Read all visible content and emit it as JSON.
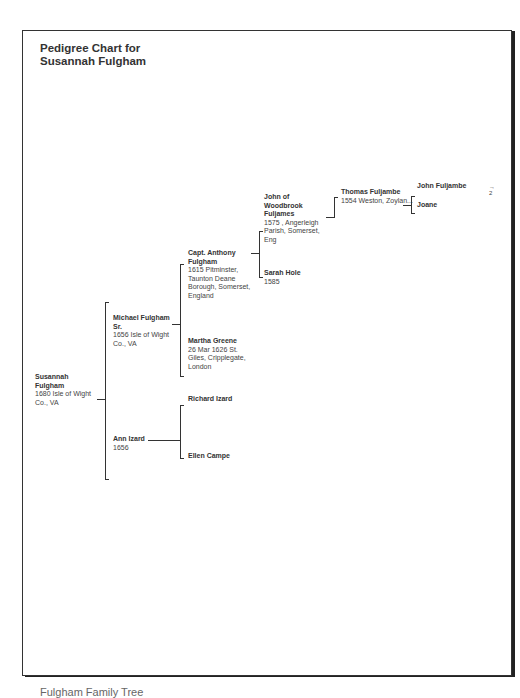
{
  "title_line1": "Pedigree Chart for",
  "title_line2": "Susannah Fulgham",
  "people": {
    "p1": {
      "name": "Susannah Fulgham",
      "name1": "Susannah",
      "name2": "Fulgham",
      "d1": "1680 Isle of Wight",
      "d2": "Co., VA"
    },
    "p2": {
      "name1": "Michael Fulgham",
      "name2": "Sr.",
      "d1": "1656 Isle of Wight",
      "d2": "Co., VA"
    },
    "p3": {
      "name1": "Ann Izard",
      "d1": "1656"
    },
    "p4": {
      "name1": "Capt. Anthony",
      "name2": "Fulgham",
      "d1": "1615 Pitminster,",
      "d2": "Taunton Deane",
      "d3": "Borough, Somerset,",
      "d4": "England"
    },
    "p5": {
      "name1": "Martha Greene",
      "d1": "26 Mar 1626 St.",
      "d2": "Giles, Cripplegate,",
      "d3": "London"
    },
    "p6": {
      "name1": "Richard Izard"
    },
    "p7": {
      "name1": "Ellen Campe"
    },
    "p8": {
      "name1": "John of",
      "name2": "Woodbrook",
      "name3": "Fuljames",
      "d1": "1575 , Angerleigh",
      "d2": "Parish, Somerset,",
      "d3": "Eng"
    },
    "p9": {
      "name1": "Sarah Hole",
      "d1": "1585"
    },
    "p16": {
      "name1": "Thomas Fuljambe",
      "d1": "1554 Weston, Zoylan..."
    },
    "p32": {
      "name1": "John Fuljambe"
    },
    "p33": {
      "name1": "Joane"
    }
  },
  "continuation_marker": "→\n2",
  "caption": "Fulgham Family Tree"
}
